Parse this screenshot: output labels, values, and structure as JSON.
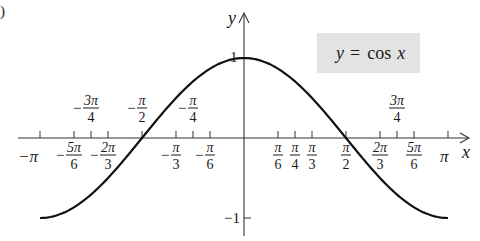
{
  "figure_label": ")",
  "chart_data": {
    "type": "line",
    "title": "",
    "function": "y = cos x",
    "legend": [
      "y = cos x"
    ],
    "xlabel": "x",
    "ylabel": "y",
    "xlim": [
      -3.14159,
      3.14159
    ],
    "ylim": [
      -1,
      1
    ],
    "grid": false,
    "legend_position": "upper right (boxed)",
    "x_ticks": [
      {
        "label": "−π",
        "value": -3.14159,
        "num": "π",
        "den": "",
        "sign": "−",
        "pos": "below"
      },
      {
        "label": "−5π/6",
        "value": -2.61799,
        "num": "5π",
        "den": "6",
        "sign": "−",
        "pos": "below"
      },
      {
        "label": "−3π/4",
        "value": -2.35619,
        "num": "3π",
        "den": "4",
        "sign": "−",
        "pos": "above"
      },
      {
        "label": "−2π/3",
        "value": -2.0944,
        "num": "2π",
        "den": "3",
        "sign": "−",
        "pos": "below"
      },
      {
        "label": "−π/2",
        "value": -1.5708,
        "num": "π",
        "den": "2",
        "sign": "−",
        "pos": "above"
      },
      {
        "label": "−π/3",
        "value": -1.0472,
        "num": "π",
        "den": "3",
        "sign": "−",
        "pos": "below"
      },
      {
        "label": "−π/4",
        "value": -0.7854,
        "num": "π",
        "den": "4",
        "sign": "−",
        "pos": "above"
      },
      {
        "label": "−π/6",
        "value": -0.5236,
        "num": "π",
        "den": "6",
        "sign": "−",
        "pos": "below"
      },
      {
        "label": "π/6",
        "value": 0.5236,
        "num": "π",
        "den": "6",
        "sign": "",
        "pos": "below"
      },
      {
        "label": "π/4",
        "value": 0.7854,
        "num": "π",
        "den": "4",
        "sign": "",
        "pos": "below"
      },
      {
        "label": "π/3",
        "value": 1.0472,
        "num": "π",
        "den": "3",
        "sign": "",
        "pos": "below"
      },
      {
        "label": "π/2",
        "value": 1.5708,
        "num": "π",
        "den": "2",
        "sign": "",
        "pos": "below"
      },
      {
        "label": "2π/3",
        "value": 2.0944,
        "num": "2π",
        "den": "3",
        "sign": "",
        "pos": "below"
      },
      {
        "label": "3π/4",
        "value": 2.35619,
        "num": "3π",
        "den": "4",
        "sign": "",
        "pos": "above"
      },
      {
        "label": "5π/6",
        "value": 2.61799,
        "num": "5π",
        "den": "6",
        "sign": "",
        "pos": "below"
      },
      {
        "label": "π",
        "value": 3.14159,
        "num": "π",
        "den": "",
        "sign": "",
        "pos": "below"
      }
    ],
    "y_ticks": [
      {
        "label": "1",
        "value": 1
      },
      {
        "label": "−1",
        "value": -1
      }
    ],
    "x": [
      -3.14159,
      -2.61799,
      -2.35619,
      -2.0944,
      -1.5708,
      -1.0472,
      -0.7854,
      -0.5236,
      0,
      0.5236,
      0.7854,
      1.0472,
      1.5708,
      2.0944,
      2.35619,
      2.61799,
      3.14159
    ],
    "series": [
      {
        "name": "y = cos x",
        "values": [
          -1,
          -0.866,
          -0.707,
          -0.5,
          0,
          0.5,
          0.707,
          0.866,
          1,
          0.866,
          0.707,
          0.5,
          0,
          -0.5,
          -0.707,
          -0.866,
          -1
        ]
      }
    ]
  },
  "legend_text": {
    "y": "y",
    "eq": "=",
    "cos": "cos",
    "x": "x"
  },
  "axis_labels": {
    "x": "x",
    "y": "y"
  },
  "style": {
    "curve_color": "#111111",
    "legend_bg": "#e3e3e3",
    "axis_color": "#333333"
  }
}
